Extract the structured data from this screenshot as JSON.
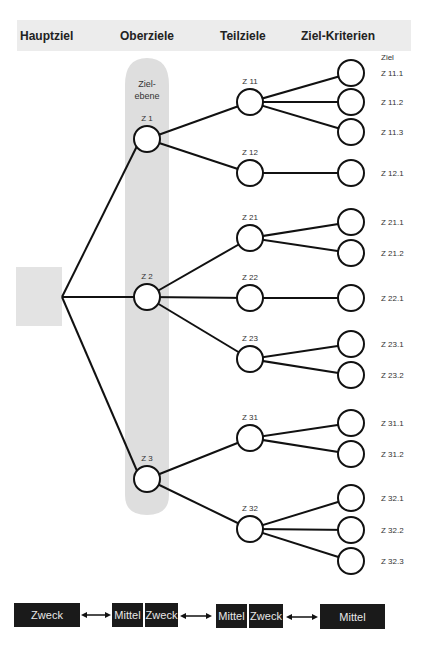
{
  "header": {
    "columns": [
      "Hauptziel",
      "Oberziele",
      "Teilziele",
      "Ziel-Kriterien"
    ]
  },
  "level_label": [
    "Ziel-",
    "ebene"
  ],
  "criteria_header": "Ziel",
  "oberziele": [
    {
      "id": "Z 1",
      "y": 139
    },
    {
      "id": "Z 2",
      "y": 297
    },
    {
      "id": "Z 3",
      "y": 479
    }
  ],
  "teilziele": [
    {
      "id": "Z 11",
      "parent": 0,
      "y": 102,
      "criteria": [
        {
          "id": "Z 11.1",
          "y": 73
        },
        {
          "id": "Z 11.2",
          "y": 102
        },
        {
          "id": "Z 11.3",
          "y": 132
        }
      ]
    },
    {
      "id": "Z 12",
      "parent": 0,
      "y": 173,
      "criteria": [
        {
          "id": "Z 12.1",
          "y": 173
        }
      ]
    },
    {
      "id": "Z 21",
      "parent": 1,
      "y": 238,
      "criteria": [
        {
          "id": "Z 21.1",
          "y": 222
        },
        {
          "id": "Z 21.2",
          "y": 253
        }
      ]
    },
    {
      "id": "Z 22",
      "parent": 1,
      "y": 298,
      "criteria": [
        {
          "id": "Z 22.1",
          "y": 298
        }
      ]
    },
    {
      "id": "Z 23",
      "parent": 1,
      "y": 359,
      "criteria": [
        {
          "id": "Z 23.1",
          "y": 344
        },
        {
          "id": "Z 23.2",
          "y": 375
        }
      ]
    },
    {
      "id": "Z 31",
      "parent": 2,
      "y": 438,
      "criteria": [
        {
          "id": "Z 31.1",
          "y": 423
        },
        {
          "id": "Z 31.2",
          "y": 454
        }
      ]
    },
    {
      "id": "Z 32",
      "parent": 2,
      "y": 529,
      "criteria": [
        {
          "id": "Z 32.1",
          "y": 498
        },
        {
          "id": "Z 32.2",
          "y": 530
        },
        {
          "id": "Z 32.3",
          "y": 561
        }
      ]
    }
  ],
  "footer": {
    "boxes": [
      "Zweck",
      "Mittel",
      "Zweck",
      "Mittel",
      "Zweck",
      "Mittel"
    ]
  },
  "colors": {
    "band": "#e6e6e6",
    "line": "#111111",
    "box": "#1a1a1a"
  }
}
